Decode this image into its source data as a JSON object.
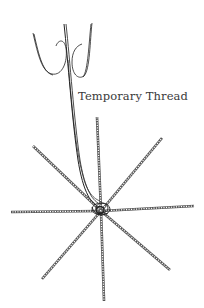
{
  "diagram": {
    "label": "Temporary Thread",
    "colors": {
      "line": "#222222",
      "spoke": "#555555",
      "text": "#3a3a3a",
      "background": "#ffffff"
    },
    "hub": {
      "x": 101,
      "y": 211
    },
    "spokes": [
      {
        "name": "top",
        "x": 97,
        "y": 117
      },
      {
        "name": "upper-right",
        "x": 162,
        "y": 138
      },
      {
        "name": "right",
        "x": 194,
        "y": 206
      },
      {
        "name": "lower-right",
        "x": 170,
        "y": 270
      },
      {
        "name": "bottom",
        "x": 104,
        "y": 301
      },
      {
        "name": "lower-left",
        "x": 42,
        "y": 279
      },
      {
        "name": "left",
        "x": 11,
        "y": 212
      },
      {
        "name": "upper-left",
        "x": 33,
        "y": 146
      }
    ]
  }
}
